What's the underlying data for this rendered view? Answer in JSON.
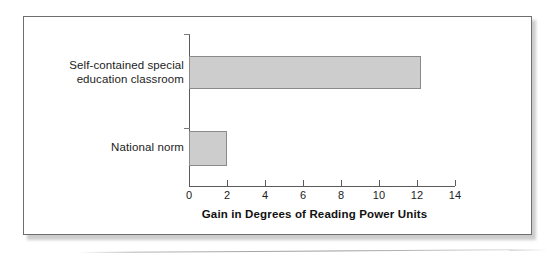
{
  "figure": {
    "frame": {
      "border_color": "#6e6e6e",
      "background": "#ffffff"
    }
  },
  "chart_data": {
    "type": "bar",
    "orientation": "horizontal",
    "title": "",
    "subtitle": "",
    "xlabel": "Gain in Degrees of Reading Power Units",
    "ylabel": "",
    "categories": [
      "Self-contained special education classroom",
      "National norm"
    ],
    "category_label_lines": [
      [
        "Self-contained special",
        "education classroom"
      ],
      [
        "National norm"
      ]
    ],
    "values": [
      12.2,
      2.0
    ],
    "xlim": [
      0,
      14
    ],
    "ylim": [
      0,
      2
    ],
    "xticks": [
      0,
      2,
      4,
      6,
      8,
      10,
      12,
      14
    ],
    "xticklabels": [
      "0",
      "2",
      "4",
      "6",
      "8",
      "10",
      "12",
      "14"
    ],
    "grid": false,
    "legend": false,
    "legend_position": "none",
    "bar_fill_color": "#cdcdcd",
    "bar_edge_color": "#8a8a8a",
    "axis_color": "#5a5a5a",
    "text_color": "#1c1c1c"
  }
}
